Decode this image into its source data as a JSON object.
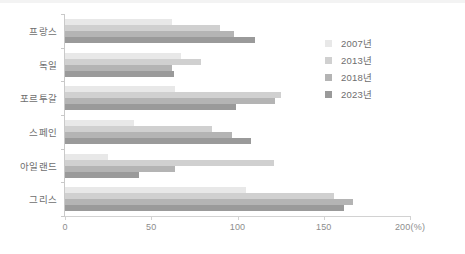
{
  "chart_data": {
    "type": "bar",
    "orientation": "horizontal",
    "title": "",
    "xlabel": "200(%)",
    "ylabel": "",
    "xlim": [
      0,
      200
    ],
    "xticks": [
      0,
      50,
      100,
      150,
      200
    ],
    "xtick_labels": [
      "0",
      "50",
      "100",
      "150",
      "200(%)"
    ],
    "grid": false,
    "legend_position": "right",
    "categories": [
      "프랑스",
      "독일",
      "포르투갈",
      "스페인",
      "아일랜드",
      "그리스"
    ],
    "series": [
      {
        "name": "2007년",
        "color": "#e8e8e8",
        "values": [
          62,
          67,
          64,
          40,
          25,
          105
        ]
      },
      {
        "name": "2013년",
        "color": "#d0d0d0",
        "values": [
          90,
          79,
          125,
          85,
          121,
          156
        ]
      },
      {
        "name": "2018년",
        "color": "#b4b4b4",
        "values": [
          98,
          62,
          122,
          97,
          64,
          167
        ]
      },
      {
        "name": "2023년",
        "color": "#9a9a9a",
        "values": [
          110,
          63,
          99,
          108,
          43,
          162
        ]
      }
    ]
  },
  "legend": {
    "items": [
      {
        "label": "2007년"
      },
      {
        "label": "2013년"
      },
      {
        "label": "2018년"
      },
      {
        "label": "2023년"
      }
    ]
  },
  "axis": {
    "x_tick_labels": [
      "0",
      "50",
      "100",
      "150",
      "200(%)"
    ]
  },
  "colors": {
    "axis": "#c9c9c9",
    "text": "#6e6e6e",
    "tick_text": "#8d8d8d",
    "background": "#ffffff"
  }
}
